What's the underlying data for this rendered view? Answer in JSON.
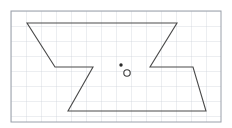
{
  "canvas": {
    "width": 232,
    "height": 128,
    "background": "#ffffff"
  },
  "grid": {
    "label": "graph-paper-grid",
    "origin_x": 11,
    "origin_y": 11,
    "width": 210,
    "height": 111,
    "cell_size": 15,
    "columns": 14,
    "rows": 7.4,
    "line_color": "#c8cdd6",
    "line_width": 0.7,
    "border_color": "#9aa0aa",
    "border_width": 1
  },
  "shape": {
    "name": "bowtie-polygon",
    "stroke_color": "#4a4a4a",
    "stroke_width": 1.1,
    "fill": "none",
    "vertices": [
      {
        "id": "v1",
        "label": "top-left",
        "x": 27,
        "y": 23
      },
      {
        "id": "v2",
        "label": "top-right",
        "x": 177,
        "y": 23
      },
      {
        "id": "v3",
        "label": "right-upper-notch",
        "x": 150,
        "y": 67
      },
      {
        "id": "v4",
        "label": "right-notch-outer",
        "x": 193,
        "y": 67
      },
      {
        "id": "v5",
        "label": "bottom-right",
        "x": 206,
        "y": 111
      },
      {
        "id": "v6",
        "label": "bottom-left",
        "x": 68,
        "y": 111
      },
      {
        "id": "v7",
        "label": "left-notch-outer",
        "x": 93,
        "y": 67
      },
      {
        "id": "v8",
        "label": "left-upper-notch",
        "x": 55,
        "y": 67
      }
    ],
    "path": "M 27 23 L 177 23 L 150 67 L 193 67 L 206 111 L 68 111 L 93 67 L 55 67 Z"
  },
  "markers": [
    {
      "id": "m1",
      "name": "filled-point-marker",
      "type": "filled-dot",
      "x": 121,
      "y": 65,
      "radius": 1.7,
      "color": "#2a2a2a"
    },
    {
      "id": "m2",
      "name": "open-circle-marker",
      "type": "open-circle",
      "x": 127,
      "y": 73,
      "radius": 3.2,
      "color": "#3a3a3a",
      "stroke_width": 1.1,
      "fill": "#ffffff"
    }
  ]
}
